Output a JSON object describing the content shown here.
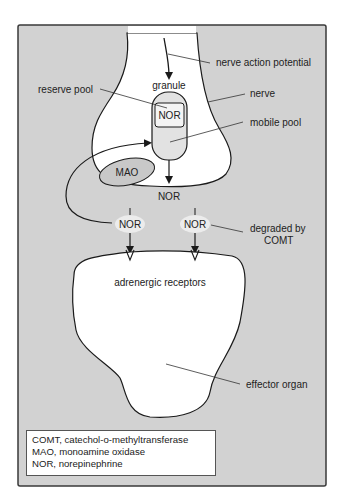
{
  "diagram": {
    "colors": {
      "panel": "#d2d2d2",
      "cell": "#ffffff",
      "shaded": "#cfcfcf",
      "stroke": "#1a1a1a",
      "border": "#3a3a3a"
    },
    "labels": {
      "nerve_action_potential": "nerve action potential",
      "granule": "granule",
      "reserve_pool": "reserve pool",
      "nerve": "nerve",
      "mobile_pool": "mobile pool",
      "nor_granule": "NOR",
      "mao": "MAO",
      "nor_released": "NOR",
      "nor_reuptake": "NOR",
      "nor_degraded": "NOR",
      "degraded_by_line1": "degraded by",
      "degraded_by_line2": "COMT",
      "adrenergic_receptors": "adrenergic receptors",
      "effector_organ": "effector organ"
    },
    "legend": [
      "COMT, catechol-o-methyltransferase",
      "MAO, monoamine oxidase",
      "NOR, norepinephrine"
    ]
  }
}
